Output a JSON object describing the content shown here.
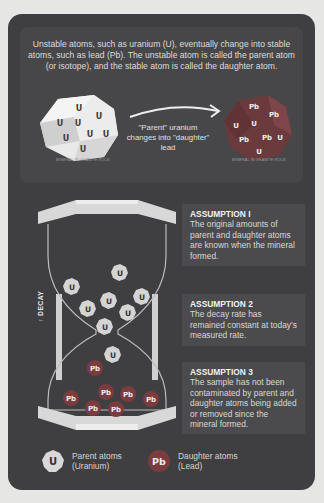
{
  "intro": {
    "text": "Unstable atoms, such as uranium (U), eventually change into stable atoms, such as lead (Pb). The unstable atom is called the parent atom (or isotope), and the stable atom is called the daughter atom."
  },
  "diagram_top": {
    "left_mineral": {
      "label": "MINERAL IN GRANITE ROCK",
      "atoms": [
        "U",
        "U",
        "U",
        "U",
        "U",
        "U",
        "U",
        "U"
      ]
    },
    "arrow_caption": "\"Parent\" uranium changes into \"daughter\" lead",
    "right_mineral": {
      "label": "MINERAL IN GRANITE ROCK",
      "atoms": [
        "Pb",
        "Pb",
        "U",
        "U",
        "Pb",
        "Pb",
        "U",
        "U"
      ]
    }
  },
  "hourglass": {
    "axis_label": "DECAY",
    "axis_arrow": "↑",
    "top_atoms": [
      "U",
      "U",
      "U",
      "U",
      "U",
      "U",
      "U"
    ],
    "falling_atom": "U",
    "bottom_atoms": [
      "Pb",
      "Pb",
      "Pb",
      "Pb",
      "Pb",
      "Pb",
      "Pb"
    ]
  },
  "assumptions": [
    {
      "title": "ASSUMPTION I",
      "text": "The original amounts of parent and daughter atoms are known when the mineral formed."
    },
    {
      "title": "ASSUMPTION 2",
      "text": "The decay rate has remained constant at today's measured rate."
    },
    {
      "title": "ASSUMPTION 3",
      "text": "The sample has not been contaminated by parent and daughter atoms being added or removed since the mineral formed."
    }
  ],
  "legend": {
    "parent": {
      "symbol": "U",
      "line1": "Parent atoms",
      "line2": "(Uranium)"
    },
    "daughter": {
      "symbol": "Pb",
      "line1": "Daughter atoms",
      "line2": "(Lead)"
    }
  },
  "colors": {
    "background": "#e6e6e4",
    "card": "#3f3f41",
    "panel": "#474749",
    "uranium_atom": "#d9d9d9",
    "lead_atom": "#7c3c3e",
    "hourglass_frame": "#d5d5d5"
  }
}
